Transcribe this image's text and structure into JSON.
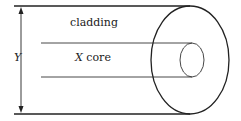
{
  "diagram": {
    "labels": {
      "cladding": "cladding",
      "core_var": "X",
      "core_word": " core",
      "dimension": "Y"
    },
    "colors": {
      "stroke": "#222222",
      "background": "#ffffff"
    }
  }
}
